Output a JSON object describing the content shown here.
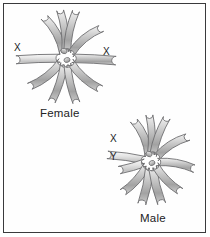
{
  "figure": {
    "background_color": "#ffffff",
    "border_color": "#3a3a3c",
    "chromosome_fill_light": "#e9e9e9",
    "chromosome_fill_mid": "#bdbdbd",
    "chromosome_fill_dark": "#8e8e8e",
    "chromosome_outline": "#6e6e70",
    "label_color": "#222224"
  },
  "groups": [
    {
      "id": "female",
      "caption": "Female",
      "sex_chromosome_labels": [
        "X",
        "X"
      ],
      "center": {
        "x": 66,
        "y": 58
      },
      "chromosomes": [
        {
          "name": "autosome-upper-left-long",
          "angle": 118,
          "length": 40,
          "width": 7.5,
          "bend": 16,
          "shade": "mid"
        },
        {
          "name": "autosome-upper-inner-left",
          "angle": 97,
          "length": 42,
          "width": 7,
          "bend": 10,
          "shade": "mid"
        },
        {
          "name": "autosome-upper-inner-right",
          "angle": 78,
          "length": 42,
          "width": 7,
          "bend": -10,
          "shade": "mid"
        },
        {
          "name": "autosome-upper-right-long",
          "angle": 40,
          "length": 40,
          "width": 7.5,
          "bend": -16,
          "shade": "mid"
        },
        {
          "name": "sex-chromosome-x-left",
          "angle": 182,
          "length": 44,
          "width": 8,
          "bend": 2,
          "shade": "light",
          "label": "X"
        },
        {
          "name": "sex-chromosome-x-right",
          "angle": 357,
          "length": 44,
          "width": 8.5,
          "bend": -2,
          "shade": "mid",
          "label": "X"
        },
        {
          "name": "autosome-lower-left-long",
          "angle": 218,
          "length": 40,
          "width": 7.5,
          "bend": -14,
          "shade": "mid"
        },
        {
          "name": "autosome-lower-inner-left",
          "angle": 252,
          "length": 40,
          "width": 7,
          "bend": -8,
          "shade": "mid"
        },
        {
          "name": "autosome-lower-inner-right",
          "angle": 283,
          "length": 40,
          "width": 7,
          "bend": 8,
          "shade": "mid"
        },
        {
          "name": "autosome-lower-right-long",
          "angle": 318,
          "length": 40,
          "width": 7.5,
          "bend": 14,
          "shade": "mid"
        }
      ],
      "central_dots": [
        {
          "name": "central-chromosome-upper",
          "x": 64,
          "y": 51,
          "rx": 3.2,
          "ry": 2.6,
          "angle": 20
        },
        {
          "name": "central-chromosome-lower",
          "x": 67,
          "y": 60,
          "rx": 3.0,
          "ry": 2.4,
          "angle": -15
        }
      ]
    },
    {
      "id": "male",
      "caption": "Male",
      "sex_chromosome_labels": [
        "X",
        "Y"
      ],
      "center": {
        "x": 151,
        "y": 161
      },
      "chromosomes": [
        {
          "name": "autosome-upper-left-long",
          "angle": 113,
          "length": 38,
          "width": 7.5,
          "bend": 16,
          "shade": "mid"
        },
        {
          "name": "autosome-upper-inner-left",
          "angle": 92,
          "length": 40,
          "width": 7,
          "bend": 9,
          "shade": "mid"
        },
        {
          "name": "autosome-upper-inner-right",
          "angle": 70,
          "length": 40,
          "width": 7,
          "bend": -9,
          "shade": "mid"
        },
        {
          "name": "autosome-upper-right-long",
          "angle": 33,
          "length": 38,
          "width": 7.5,
          "bend": -15,
          "shade": "mid"
        },
        {
          "name": "sex-chromosome-x",
          "angle": 172,
          "length": 38,
          "width": 7.5,
          "bend": 4,
          "shade": "light",
          "label": "X"
        },
        {
          "name": "sex-chromosome-y",
          "angle": 196,
          "length": 27,
          "width": 7.5,
          "bend": -4,
          "shade": "light",
          "label": "Y"
        },
        {
          "name": "autosome-right-lateral",
          "angle": 350,
          "length": 38,
          "width": 7.5,
          "bend": -12,
          "shade": "mid"
        },
        {
          "name": "autosome-lower-left-long",
          "angle": 228,
          "length": 36,
          "width": 7.5,
          "bend": -12,
          "shade": "mid"
        },
        {
          "name": "autosome-lower-inner-left",
          "angle": 258,
          "length": 38,
          "width": 8,
          "bend": -6,
          "shade": "mid"
        },
        {
          "name": "autosome-lower-inner-right",
          "angle": 284,
          "length": 38,
          "width": 8,
          "bend": 6,
          "shade": "mid"
        },
        {
          "name": "autosome-lower-right-long",
          "angle": 314,
          "length": 36,
          "width": 7.5,
          "bend": 12,
          "shade": "mid"
        }
      ],
      "central_dots": [
        {
          "name": "central-chromosome-upper",
          "x": 149,
          "y": 154,
          "rx": 3.2,
          "ry": 2.6,
          "angle": 25
        },
        {
          "name": "central-chromosome-lower",
          "x": 152,
          "y": 163,
          "rx": 3.0,
          "ry": 2.4,
          "angle": -20
        }
      ]
    }
  ]
}
